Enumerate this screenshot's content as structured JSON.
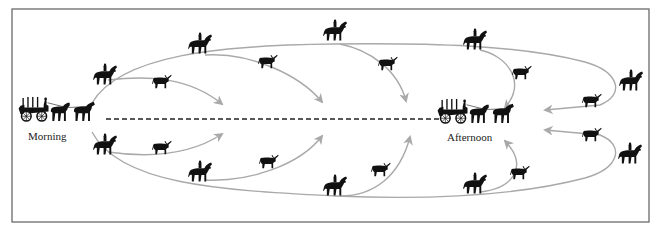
{
  "labels": {
    "morning": "Morning",
    "afternoon": "Afternoon"
  },
  "colors": {
    "frame": "#6a6a6a",
    "arrow": "#a9a9a9",
    "silhouette": "#111111",
    "dashed_line": "#222222"
  },
  "figures": {
    "wagons": [
      {
        "id": "morning-wagon",
        "x": 18,
        "y": 96,
        "label_key": "morning"
      },
      {
        "id": "afternoon-wagon",
        "x": 440,
        "y": 96,
        "label_key": "afternoon"
      }
    ],
    "riders": [
      {
        "x": 93,
        "y": 64
      },
      {
        "x": 93,
        "y": 132
      },
      {
        "x": 190,
        "y": 33
      },
      {
        "x": 190,
        "y": 160
      },
      {
        "x": 325,
        "y": 20
      },
      {
        "x": 325,
        "y": 175
      },
      {
        "x": 464,
        "y": 28
      },
      {
        "x": 464,
        "y": 172
      },
      {
        "x": 620,
        "y": 68
      },
      {
        "x": 618,
        "y": 140
      }
    ],
    "steers": [
      {
        "x": 152,
        "y": 76
      },
      {
        "x": 152,
        "y": 140
      },
      {
        "x": 258,
        "y": 54
      },
      {
        "x": 258,
        "y": 155
      },
      {
        "x": 378,
        "y": 56
      },
      {
        "x": 371,
        "y": 163
      },
      {
        "x": 512,
        "y": 66
      },
      {
        "x": 510,
        "y": 165
      },
      {
        "x": 582,
        "y": 93
      },
      {
        "x": 582,
        "y": 126
      }
    ]
  }
}
